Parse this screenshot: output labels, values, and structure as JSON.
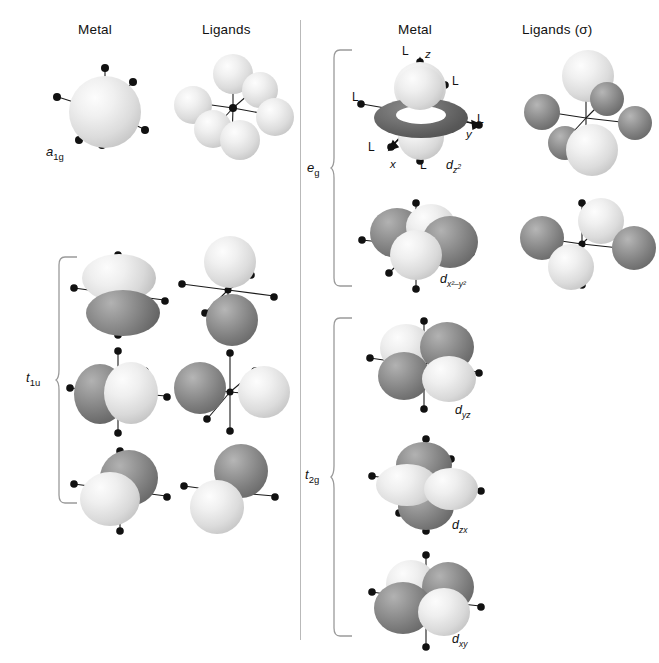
{
  "figure": {
    "divider_color": "#b9b9b9",
    "background": "#ffffff",
    "sphere_light_color": "#e8e8e8",
    "sphere_dark_color": "#7d7d7d"
  },
  "left_panel": {
    "headers": {
      "metal": "Metal",
      "ligands": "Ligands"
    },
    "rows": [
      {
        "symmetry": "a",
        "symmetry_sub": "1g",
        "metal_orbital": "s",
        "description": "spherical s orbital with six ligand bonds"
      },
      {
        "symmetry": "t",
        "symmetry_sub": "1u",
        "metal_orbital": "p",
        "description": "three p orbitals oriented along z, y and x"
      }
    ],
    "t1u_rows": [
      {
        "orientation": "pz",
        "top_lobe": "light",
        "bottom_lobe": "dark"
      },
      {
        "orientation": "py",
        "left_lobe": "dark",
        "right_lobe": "light"
      },
      {
        "orientation": "px",
        "near_lobe": "dark",
        "far_lobe": "light"
      }
    ]
  },
  "right_panel": {
    "headers": {
      "metal": "Metal",
      "ligands": "Ligands (σ)"
    },
    "eg": {
      "symmetry": "e",
      "symmetry_sub": "g",
      "orbitals": [
        {
          "label_main": "d",
          "label_sub": "z",
          "label_sup": "2",
          "name": "dz2"
        },
        {
          "label_main": "d",
          "label_sub_full": "x²–y²",
          "name": "dx2-y2"
        }
      ]
    },
    "t2g": {
      "symmetry": "t",
      "symmetry_sub": "2g",
      "orbitals": [
        {
          "label_main": "d",
          "label_sub": "yz",
          "name": "dyz"
        },
        {
          "label_main": "d",
          "label_sub": "zx",
          "name": "dzx"
        },
        {
          "label_main": "d",
          "label_sub": "xy",
          "name": "dxy"
        }
      ]
    },
    "axes": {
      "z": "z",
      "y": "y",
      "x": "x"
    },
    "ligand_markers": [
      "L",
      "L",
      "L",
      "L",
      "L",
      "L"
    ]
  }
}
